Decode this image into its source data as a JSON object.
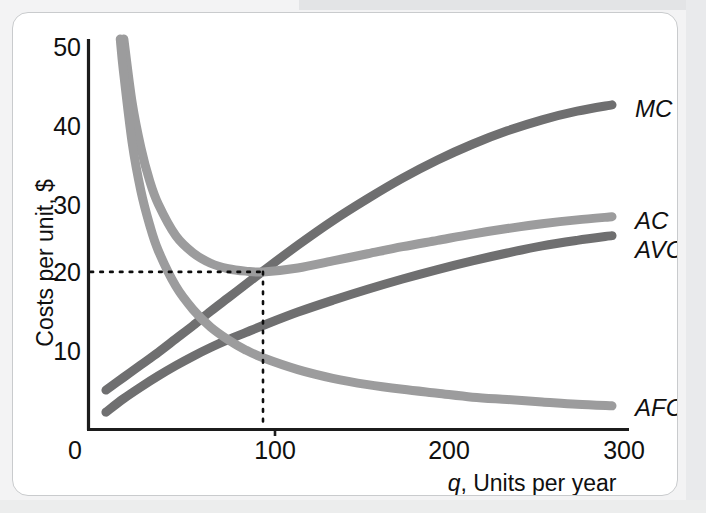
{
  "figure": {
    "card_background": "#ffffff",
    "card_border_color": "#c9cbcd"
  },
  "chart_data": {
    "type": "line",
    "title": "",
    "subtitle": "",
    "xlabel": "q, Units per year",
    "xlabel_italic_part": "q",
    "xlabel_rest": ", Units per year",
    "ylabel": "Costs per unit, $",
    "xlim": [
      0,
      300
    ],
    "ylim": [
      0,
      52
    ],
    "xticks": [
      0,
      100,
      200,
      300
    ],
    "xtick_labels": [
      "0",
      "100",
      "200",
      "300"
    ],
    "yticks": [
      10,
      20,
      30,
      40,
      50
    ],
    "ytick_labels": [
      "10",
      "20",
      "30",
      "40",
      "50"
    ],
    "grid": false,
    "legend_position": "right-inline-curve-labels",
    "annotations": [
      {
        "name": "minimum-ac-guide",
        "type": "dotted-crosshair",
        "x": 100,
        "y": 20,
        "description": "MC crosses AC at the minimum of AC at q = 100, $20"
      }
    ],
    "series": [
      {
        "name": "MC",
        "label": "MC",
        "color": "#6f6f70",
        "x": [
          10,
          20,
          30,
          40,
          50,
          60,
          70,
          80,
          90,
          100,
          120,
          140,
          160,
          180,
          200,
          220,
          240,
          260,
          280,
          300
        ],
        "values": [
          5.0,
          6.6,
          8.2,
          9.8,
          11.5,
          13.2,
          15.0,
          16.7,
          18.4,
          20.1,
          23.4,
          26.5,
          29.3,
          31.9,
          34.2,
          36.2,
          37.9,
          39.3,
          40.4,
          41.2
        ]
      },
      {
        "name": "AC",
        "label": "AC",
        "color": "#9c9c9d",
        "x": [
          18,
          20,
          25,
          30,
          35,
          40,
          50,
          60,
          70,
          80,
          90,
          100,
          120,
          140,
          160,
          180,
          200,
          220,
          240,
          260,
          280,
          300
        ],
        "values": [
          52.0,
          50.0,
          41.5,
          35.8,
          31.6,
          28.6,
          24.6,
          22.4,
          21.1,
          20.4,
          20.1,
          20.0,
          20.5,
          21.4,
          22.3,
          23.2,
          24.0,
          24.8,
          25.5,
          26.1,
          26.6,
          27.0
        ]
      },
      {
        "name": "AVC",
        "label": "AVC",
        "color": "#6f6f70",
        "x": [
          10,
          20,
          30,
          40,
          50,
          60,
          70,
          80,
          90,
          100,
          120,
          140,
          160,
          180,
          200,
          220,
          240,
          260,
          280,
          300
        ],
        "values": [
          2.2,
          3.9,
          5.4,
          6.8,
          8.1,
          9.3,
          10.4,
          11.4,
          12.3,
          13.2,
          14.9,
          16.4,
          17.8,
          19.1,
          20.3,
          21.4,
          22.4,
          23.3,
          24.0,
          24.6
        ]
      },
      {
        "name": "AFC",
        "label": "AFC",
        "color": "#9c9c9d",
        "x": [
          18,
          20,
          25,
          30,
          35,
          40,
          50,
          60,
          70,
          80,
          90,
          100,
          120,
          140,
          160,
          180,
          200,
          220,
          240,
          260,
          280,
          300
        ],
        "values": [
          50.0,
          45.5,
          36.4,
          30.3,
          26.0,
          22.7,
          18.2,
          15.2,
          13.0,
          11.4,
          10.1,
          9.1,
          7.6,
          6.5,
          5.7,
          5.1,
          4.6,
          4.1,
          3.8,
          3.5,
          3.2,
          3.0
        ]
      }
    ]
  }
}
